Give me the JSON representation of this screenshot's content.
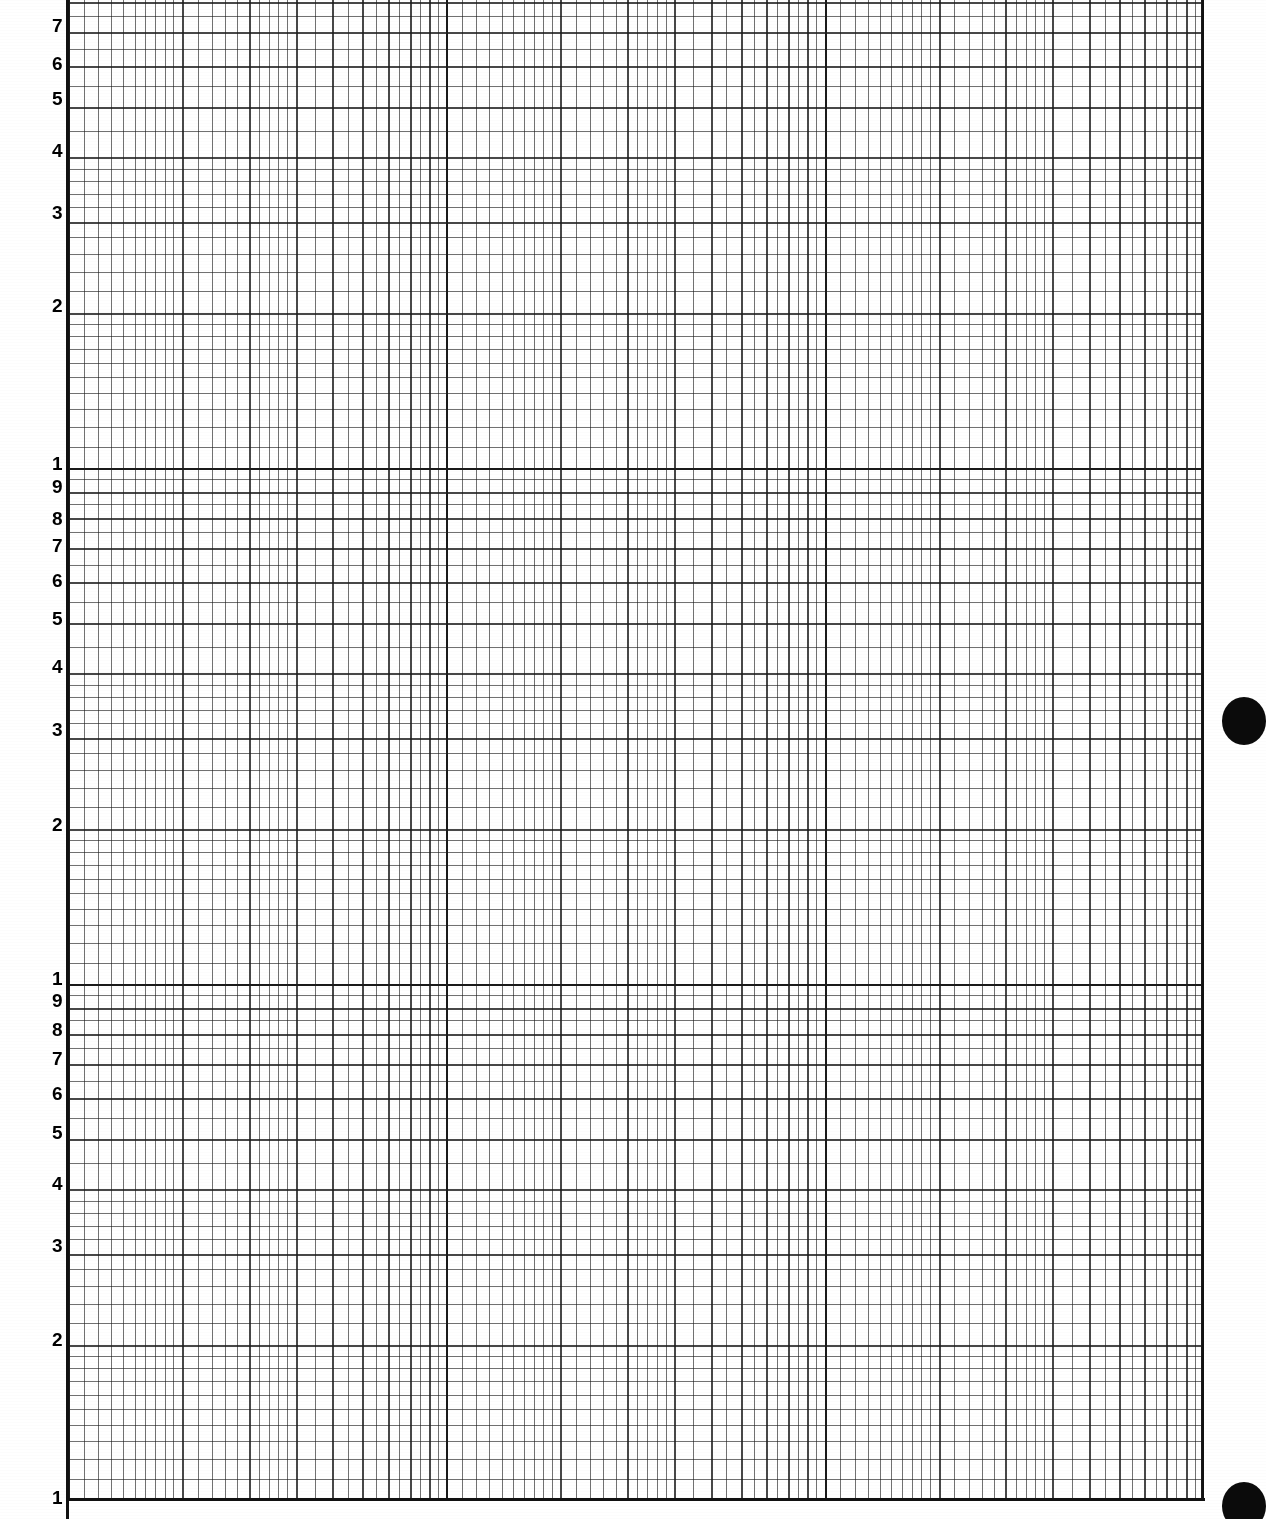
{
  "document": {
    "title": "Logarithmic graph paper",
    "sheet_width": 1266,
    "sheet_height": 1519,
    "paper_color": "#ffffff",
    "ink_color": "#1a1a1a"
  },
  "marks": {
    "punch_hole_upper": "punch-hole",
    "punch_hole_lower": "punch-hole"
  },
  "chart_data": {
    "type": "line",
    "title": "",
    "subtitle": "",
    "xlabel": "",
    "ylabel": "",
    "grid": true,
    "legend": [],
    "annotations": [],
    "series": [],
    "scale": {
      "x": "log10",
      "y": "log10"
    },
    "x_axis": {
      "scale": "log10",
      "cycles": 3,
      "decade_fraction_start": 0.58,
      "tick_labels": [],
      "tick_values": [
        1,
        2,
        3,
        4,
        5,
        6,
        7,
        8,
        9,
        10
      ],
      "minor_subdivisions": [
        1.0,
        1.1,
        1.2,
        1.3,
        1.4,
        1.5,
        1.6,
        1.7,
        1.8,
        1.9,
        2.0,
        2.2,
        2.4,
        2.6,
        2.8,
        3.0,
        3.2,
        3.4,
        3.6,
        3.8,
        4.0,
        4.5,
        5.0,
        5.5,
        6.0,
        6.5,
        7.0,
        7.5,
        8.0,
        8.5,
        9.0,
        9.5,
        10.0
      ],
      "grid_left_px": 68,
      "grid_right_px": 1203
    },
    "y_axis": {
      "scale": "log10",
      "cycles": 3,
      "direction": "descending-top-to-bottom",
      "tick_labels": [
        "7",
        "6",
        "5",
        "4",
        "3",
        "2",
        "1",
        "9",
        "8",
        "7",
        "6",
        "5",
        "4",
        "3",
        "2",
        "1",
        "9",
        "8",
        "7",
        "6",
        "5",
        "4",
        "3",
        "2",
        "1"
      ],
      "decade_markers": [
        "1",
        "1",
        "1"
      ],
      "tick_values": [
        1,
        2,
        3,
        4,
        5,
        6,
        7,
        8,
        9,
        10
      ],
      "minor_subdivisions": [
        1.0,
        1.1,
        1.2,
        1.3,
        1.4,
        1.5,
        1.6,
        1.7,
        1.8,
        1.9,
        2.0,
        2.2,
        2.4,
        2.6,
        2.8,
        3.0,
        3.2,
        3.4,
        3.6,
        3.8,
        4.0,
        4.5,
        5.0,
        5.5,
        6.0,
        6.5,
        7.0,
        7.5,
        8.0,
        8.5,
        9.0,
        9.5,
        10.0
      ],
      "grid_top_px": 0,
      "grid_bottom_px": 1500,
      "top_cropped": true
    },
    "labels_ordered_top_to_bottom": [
      {
        "text": "7",
        "y": 25
      },
      {
        "text": "6",
        "y": 63
      },
      {
        "text": "5",
        "y": 98
      },
      {
        "text": "4",
        "y": 150
      },
      {
        "text": "3",
        "y": 212
      },
      {
        "text": "2",
        "y": 305
      },
      {
        "text": "1",
        "y": 463
      },
      {
        "text": "9",
        "y": 486
      },
      {
        "text": "8",
        "y": 518
      },
      {
        "text": "7",
        "y": 545
      },
      {
        "text": "6",
        "y": 580
      },
      {
        "text": "5",
        "y": 618
      },
      {
        "text": "4",
        "y": 666
      },
      {
        "text": "3",
        "y": 729
      },
      {
        "text": "2",
        "y": 824
      },
      {
        "text": "1",
        "y": 978
      },
      {
        "text": "9",
        "y": 1000
      },
      {
        "text": "8",
        "y": 1029
      },
      {
        "text": "7",
        "y": 1058
      },
      {
        "text": "6",
        "y": 1093
      },
      {
        "text": "5",
        "y": 1132
      },
      {
        "text": "4",
        "y": 1183
      },
      {
        "text": "3",
        "y": 1245
      },
      {
        "text": "2",
        "y": 1339
      },
      {
        "text": "1",
        "y": 1497
      }
    ]
  }
}
